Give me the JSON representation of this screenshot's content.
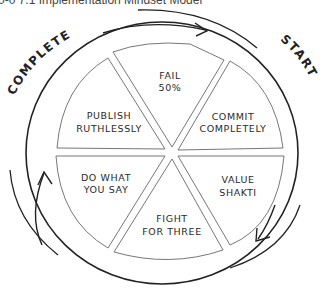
{
  "title": "0-0 7.1 Implementation Mindset Model",
  "cycle_labels": {
    "start": "START",
    "complete": "COMPLETE"
  },
  "segments": [
    {
      "line1": "FAIL",
      "line2": "50%"
    },
    {
      "line1": "COMMIT",
      "line2": "COMPLETELY"
    },
    {
      "line1": "VALUE",
      "line2": "SHAKTI"
    },
    {
      "line1": "FIGHT",
      "line2": "FOR THREE"
    },
    {
      "line1": "DO WHAT",
      "line2": "YOU SAY"
    },
    {
      "line1": "PUBLISH",
      "line2": "RUTHLESSLY"
    }
  ],
  "colors": {
    "stroke": "#222222",
    "segment_stroke": "#777777",
    "text": "#2a2a2a"
  }
}
